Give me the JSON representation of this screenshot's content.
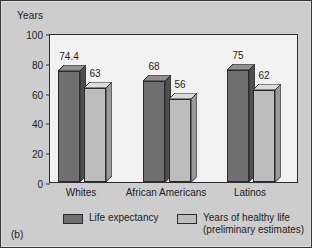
{
  "figure": {
    "caption": "(b)",
    "background_color": "#cdcdcd",
    "plot_background_color": "#f2f2f2"
  },
  "chart_data": {
    "type": "bar",
    "title": "",
    "subtitle": "",
    "xlabel": "",
    "ylabel": "Years",
    "ylim": [
      0,
      100
    ],
    "yticks": [
      "0",
      "20",
      "40",
      "60",
      "80",
      "100"
    ],
    "grid": false,
    "legend_position": "bottom",
    "style": "3d-column",
    "categories": [
      "Whites",
      "African Americans",
      "Latinos"
    ],
    "series": [
      {
        "name": "Life expectancy",
        "color": "#6f6f6f",
        "values": [
          74.4,
          68,
          75
        ],
        "labels": [
          "74.4",
          "68",
          "75"
        ]
      },
      {
        "name": "Years of healthy life (preliminary estimates)",
        "name_line1": "Years of healthy life",
        "name_line2": "(preliminary estimates)",
        "color": "#bdbdbd",
        "values": [
          63,
          56,
          62
        ],
        "labels": [
          "63",
          "56",
          "62"
        ]
      }
    ]
  }
}
